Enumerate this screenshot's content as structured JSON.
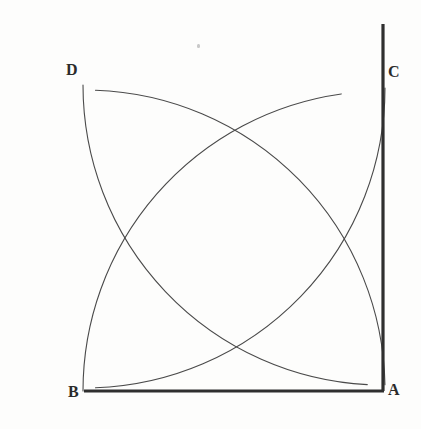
{
  "figure": {
    "background_color": "#fdfdfc",
    "stroke_color": "#2f2f2f",
    "arc_stroke_color": "#4a4a4a",
    "thick_stroke_width": 3.2,
    "thin_stroke_width": 1.1,
    "canvas": {
      "width": 421,
      "height": 429
    }
  },
  "labels": {
    "a": "A",
    "b": "B",
    "c": "C",
    "d": "D"
  },
  "chart_data": {
    "type": "scatter",
    "xlabel": "",
    "ylabel": "",
    "xlim": [
      0,
      421
    ],
    "ylim": [
      0,
      429
    ],
    "grid": false,
    "legend": "none",
    "vertices": [
      {
        "name": "A",
        "x": 383,
        "y": 391,
        "label": "A",
        "label_x": 392,
        "label_y": 396
      },
      {
        "name": "B",
        "x": 85,
        "y": 390,
        "label": "B",
        "label_x": 72,
        "label_y": 398
      },
      {
        "name": "C",
        "x": 383,
        "y": 85,
        "label": "C",
        "label_x": 392,
        "label_y": 78
      },
      {
        "name": "D",
        "x": 85,
        "y": 88,
        "label": "D",
        "label_x": 70,
        "label_y": 76
      }
    ],
    "segments": [
      {
        "name": "side-AB",
        "from": "B",
        "to": "A",
        "x1": 84,
        "y1": 391,
        "x2": 384,
        "y2": 391,
        "weight": "thick"
      },
      {
        "name": "side-AC",
        "from": "A",
        "to": "C-extended",
        "x1": 383,
        "y1": 391,
        "x2": 383,
        "y2": 24,
        "weight": "thick"
      }
    ],
    "arcs": [
      {
        "name": "arc-centered-at-A",
        "center_x": 383,
        "center_y": 391,
        "radius": 300,
        "from_deg": 180,
        "to_deg": 262,
        "weight": "thin",
        "note": "sweeps from B up to near C"
      },
      {
        "name": "arc-centered-at-B",
        "center_x": 85,
        "center_y": 390,
        "radius": 300,
        "from_deg": 272,
        "to_deg": 359,
        "weight": "thin",
        "note": "sweeps from above B over to A"
      },
      {
        "name": "arc-centered-at-C",
        "center_x": 383,
        "center_y": 85,
        "radius": 300,
        "from_deg": 93,
        "to_deg": 180,
        "weight": "thin",
        "note": "sweeps from near B left-down to D line"
      },
      {
        "name": "arc-centered-at-D",
        "center_x": 85,
        "center_y": 88,
        "radius": 300,
        "from_deg": 0,
        "to_deg": 88,
        "weight": "thin",
        "note": "sweeps right to C then down to A"
      }
    ],
    "intersections": [
      {
        "name": "top-crossing",
        "x": 230,
        "y": 126
      },
      {
        "name": "bottom-crossing",
        "x": 232,
        "y": 352
      },
      {
        "name": "left-crossing",
        "x": 123,
        "y": 240
      },
      {
        "name": "right-crossing",
        "x": 342,
        "y": 240
      }
    ],
    "marks": [
      {
        "name": "paper-speck",
        "x": 198,
        "y": 46
      }
    ]
  }
}
